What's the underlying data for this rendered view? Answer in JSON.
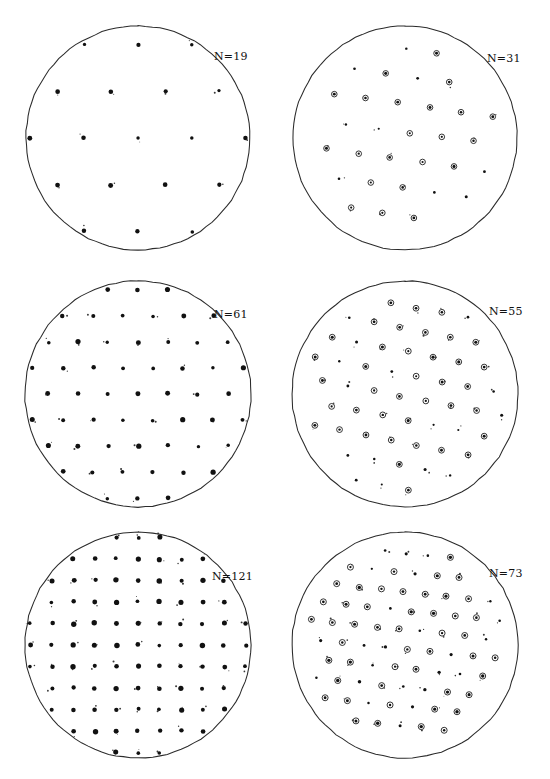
{
  "figure": {
    "type": "pole-figure-grid",
    "background_color": "#ffffff",
    "ink_color": "#1a1a1a",
    "rows": 3,
    "columns": 2,
    "width": 550,
    "height": 779
  },
  "panels": [
    {
      "id": "panel-1",
      "label": "N=19",
      "count": 19,
      "label_x": 214,
      "label_y": 50,
      "circle": {
        "cx": 138,
        "cy": 138,
        "r": 112
      },
      "marker_style": "filled-dot",
      "lattice": {
        "kind": "triangular",
        "spacing": 54,
        "angle_deg": 0,
        "offset_x": 0,
        "offset_y": 0
      },
      "dot_radius": 2.0,
      "ring_radius": 0,
      "speckle": 1
    },
    {
      "id": "panel-2",
      "label": "N=31",
      "count": 31,
      "label_x": 487,
      "label_y": 52,
      "circle": {
        "cx": 405,
        "cy": 138,
        "r": 112
      },
      "marker_style": "ring-and-dot",
      "lattice": {
        "kind": "triangular",
        "spacing": 32,
        "angle_deg": 8,
        "offset_x": 4,
        "offset_y": -6
      },
      "dot_radius": 1.3,
      "ring_radius": 2.8,
      "speckle": 2
    },
    {
      "id": "panel-3",
      "label": "N=61",
      "count": 61,
      "label_x": 214,
      "label_y": 308,
      "circle": {
        "cx": 138,
        "cy": 394,
        "r": 113
      },
      "marker_style": "filled-dot",
      "lattice": {
        "kind": "triangular",
        "spacing": 30,
        "angle_deg": 0,
        "offset_x": 0,
        "offset_y": 0
      },
      "dot_radius": 2.1,
      "ring_radius": 0,
      "speckle": 3
    },
    {
      "id": "panel-4",
      "label": "N=55",
      "count": 55,
      "label_x": 489,
      "label_y": 305,
      "circle": {
        "cx": 405,
        "cy": 394,
        "r": 113
      },
      "marker_style": "ring-and-dot",
      "lattice": {
        "kind": "triangular",
        "spacing": 26,
        "angle_deg": 11,
        "offset_x": -5,
        "offset_y": 3
      },
      "dot_radius": 1.3,
      "ring_radius": 2.9,
      "speckle": 4
    },
    {
      "id": "panel-5",
      "label": "N=121",
      "count": 121,
      "label_x": 212,
      "label_y": 570,
      "circle": {
        "cx": 138,
        "cy": 645,
        "r": 113
      },
      "marker_style": "filled-dot",
      "lattice": {
        "kind": "square",
        "spacing": 21.5,
        "angle_deg": 0,
        "offset_x": 0,
        "offset_y": 0
      },
      "dot_radius": 2.2,
      "ring_radius": 0,
      "speckle": 5
    },
    {
      "id": "panel-6",
      "label": "N=73",
      "count": 73,
      "label_x": 489,
      "label_y": 567,
      "circle": {
        "cx": 405,
        "cy": 645,
        "r": 113
      },
      "marker_style": "ring-and-dot",
      "lattice": {
        "kind": "triangular",
        "spacing": 22,
        "angle_deg": 6,
        "offset_x": 3,
        "offset_y": 4
      },
      "dot_radius": 1.4,
      "ring_radius": 3.0,
      "speckle": 6
    }
  ],
  "chart_data": {
    "type": "scatter",
    "title": "",
    "subtitle": "",
    "xlabel": "",
    "ylabel": "",
    "grid": false,
    "legend_position": "none",
    "annotations": [
      "N=19",
      "N=31",
      "N=61",
      "N=55",
      "N=121",
      "N=73"
    ],
    "projection": "stereographic-pole-figure",
    "series": [
      {
        "name": "N=19",
        "count": 19,
        "marker": "filled-dot",
        "lattice": "triangular",
        "points_drawn": 19
      },
      {
        "name": "N=31",
        "count": 31,
        "marker": "ring-and-dot",
        "lattice": "triangular",
        "points_drawn": 31
      },
      {
        "name": "N=61",
        "count": 61,
        "marker": "filled-dot",
        "lattice": "triangular",
        "points_drawn": 61
      },
      {
        "name": "N=55",
        "count": 55,
        "marker": "ring-and-dot",
        "lattice": "triangular",
        "points_drawn": 55
      },
      {
        "name": "N=121",
        "count": 121,
        "marker": "filled-dot",
        "lattice": "square",
        "points_drawn": 121
      },
      {
        "name": "N=73",
        "count": 73,
        "marker": "ring-and-dot",
        "lattice": "triangular",
        "points_drawn": 73
      }
    ]
  }
}
